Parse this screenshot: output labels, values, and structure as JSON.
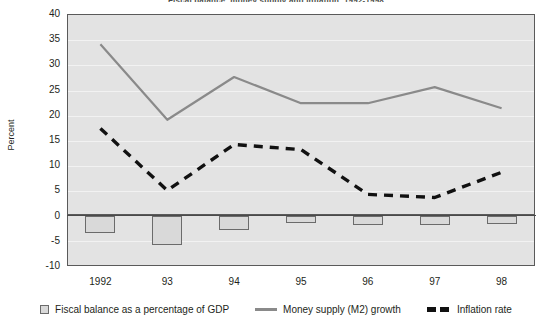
{
  "figure": {
    "title": "Fiscal balance, money supply and inflation, 1992-1998",
    "y_axis_title": "Percent"
  },
  "axis": {
    "y_ticks": [
      "40",
      "35",
      "30",
      "25",
      "20",
      "15",
      "10",
      "5",
      "0",
      "-5",
      "-10"
    ],
    "x_ticks": [
      "1992",
      "93",
      "94",
      "95",
      "96",
      "97",
      "98"
    ]
  },
  "legend": {
    "items": [
      {
        "label": "Fiscal balance as a percentage of GDP",
        "marker": "box-swatch-icon",
        "color": "#d9d9d9"
      },
      {
        "label": "Money supply (M2) growth",
        "marker": "solid-line-icon",
        "color": "#8a8a8a"
      },
      {
        "label": "Inflation rate",
        "marker": "dashed-line-icon",
        "color": "#111111"
      }
    ]
  },
  "chart_data": {
    "type": "line",
    "title": "Fiscal balance, money supply and inflation, 1992-1998",
    "xlabel": "",
    "ylabel": "Percent",
    "ylim": [
      -10,
      40
    ],
    "ytick_step": 5,
    "grid": true,
    "legend_position": "bottom",
    "categories": [
      "1992",
      "93",
      "94",
      "95",
      "96",
      "97",
      "98"
    ],
    "series": [
      {
        "name": "Fiscal balance as a percentage of GDP",
        "type": "bar",
        "color": "#d9d9d9",
        "values": [
          -3.4,
          -5.8,
          -2.8,
          -1.4,
          -1.8,
          -1.8,
          -1.6
        ]
      },
      {
        "name": "Money supply (M2) growth",
        "type": "line",
        "color": "#8a8a8a",
        "values": [
          34.0,
          19.0,
          27.5,
          22.3,
          22.3,
          25.5,
          21.3
        ]
      },
      {
        "name": "Inflation rate",
        "type": "line",
        "style": "dashed",
        "color": "#111111",
        "values": [
          17.3,
          5.0,
          14.1,
          13.1,
          4.2,
          3.6,
          8.6
        ]
      }
    ]
  }
}
